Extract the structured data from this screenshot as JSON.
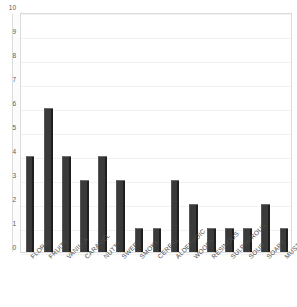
{
  "chart": {
    "type": "bar",
    "title_remnant": "",
    "axis": {
      "y_ticks": [
        0,
        1,
        2,
        3,
        4,
        5,
        6,
        7,
        8,
        9,
        10
      ],
      "ylim": [
        0,
        10
      ],
      "grid": true,
      "legend": "none"
    },
    "colors": {
      "bar": "#3a3a3a",
      "bar_highlight": "#6e6e6e",
      "bar_shadow": "#1f1f1f",
      "plot_background": "#ffffff",
      "plot_border": "#dcdcdc",
      "gridline": "#f2f2f2",
      "tick_text": "#4a4a4a"
    }
  },
  "chart_data": {
    "type": "bar",
    "title": "",
    "xlabel": "",
    "ylabel": "",
    "ylim": [
      0,
      10
    ],
    "yticks": [
      0,
      1,
      2,
      3,
      4,
      5,
      6,
      7,
      8,
      9,
      10
    ],
    "grid": true,
    "legend": null,
    "categories": [
      "FLORAL",
      "FRUITY",
      "VANILLA",
      "CARAMEL",
      "NUTTY",
      "SWEET",
      "SMOKY",
      "CEREAL",
      "ALDEHYDIC",
      "WOODY",
      "RESINOUS",
      "SULPHUROUS",
      "SOUR",
      "SOAPY",
      "MUSTY"
    ],
    "values": [
      4,
      6,
      4,
      3,
      4,
      3,
      1,
      1,
      3,
      2,
      1,
      1,
      1,
      2,
      1
    ]
  }
}
